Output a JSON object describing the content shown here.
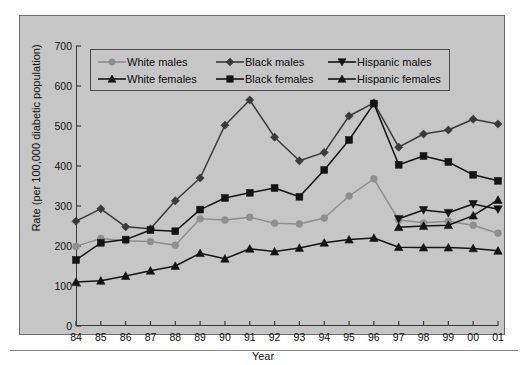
{
  "chart_data": {
    "type": "line",
    "title": "",
    "xlabel": "Year",
    "ylabel": "Rate (per 100,000 diabetic population)",
    "xlim": [
      1984,
      2001
    ],
    "ylim": [
      0,
      700
    ],
    "ytick_step": 100,
    "grid": false,
    "legend_position": "top-left-inside",
    "categories": [
      "84",
      "85",
      "86",
      "87",
      "88",
      "89",
      "90",
      "91",
      "92",
      "93",
      "94",
      "95",
      "96",
      "97",
      "98",
      "99",
      "00",
      "01"
    ],
    "x": [
      1984,
      1985,
      1986,
      1987,
      1988,
      1989,
      1990,
      1991,
      1992,
      1993,
      1994,
      1995,
      1996,
      1997,
      1998,
      1999,
      2000,
      2001
    ],
    "series": [
      {
        "name": "White males",
        "color": "#8f8f8f",
        "marker": "circle",
        "values": [
          199,
          219,
          213,
          211,
          202,
          268,
          265,
          272,
          257,
          255,
          270,
          325,
          368,
          265,
          258,
          262,
          252,
          232
        ]
      },
      {
        "name": "White females",
        "color": "#141414",
        "marker": "triangle-up",
        "values": [
          110,
          113,
          125,
          138,
          150,
          182,
          168,
          193,
          186,
          195,
          208,
          216,
          220,
          197,
          196,
          196,
          194,
          188
        ]
      },
      {
        "name": "Black males",
        "color": "#3a3a3a",
        "marker": "diamond",
        "values": [
          262,
          293,
          248,
          243,
          313,
          370,
          502,
          565,
          472,
          413,
          434,
          525,
          558,
          447,
          480,
          490,
          517,
          505
        ]
      },
      {
        "name": "Black females",
        "color": "#141414",
        "marker": "square",
        "values": [
          165,
          208,
          216,
          240,
          237,
          291,
          320,
          333,
          345,
          323,
          390,
          465,
          556,
          403,
          425,
          410,
          378,
          363
        ]
      },
      {
        "name": "Hispanic males",
        "color": "#141414",
        "marker": "triangle-down",
        "values": [
          null,
          null,
          null,
          null,
          null,
          null,
          null,
          null,
          null,
          null,
          null,
          null,
          null,
          268,
          290,
          283,
          305,
          292
        ]
      },
      {
        "name": "Hispanic females",
        "color": "#141414",
        "marker": "triangle-up",
        "values": [
          null,
          null,
          null,
          null,
          null,
          null,
          null,
          null,
          null,
          null,
          null,
          null,
          null,
          247,
          250,
          252,
          276,
          315
        ]
      }
    ]
  },
  "legend": {
    "entries": [
      {
        "label": "White males",
        "marker": "circle",
        "color": "#8f8f8f"
      },
      {
        "label": "Black males",
        "marker": "diamond",
        "color": "#3a3a3a"
      },
      {
        "label": "Hispanic males",
        "marker": "triangle-down",
        "color": "#141414"
      },
      {
        "label": "White females",
        "marker": "triangle-up",
        "color": "#141414"
      },
      {
        "label": "Black females",
        "marker": "square",
        "color": "#141414"
      },
      {
        "label": "Hispanic females",
        "marker": "triangle-up",
        "color": "#141414"
      }
    ]
  },
  "axes": {
    "ytick_labels": [
      "700",
      "600",
      "500",
      "400",
      "300",
      "200",
      "100",
      "0"
    ],
    "xtick_labels": [
      "84",
      "85",
      "86",
      "87",
      "88",
      "89",
      "90",
      "91",
      "92",
      "93",
      "94",
      "95",
      "96",
      "97",
      "98",
      "99",
      "00",
      "01"
    ],
    "ylabel": "Rate (per 100,000 diabetic population)",
    "xlabel": "Year"
  }
}
